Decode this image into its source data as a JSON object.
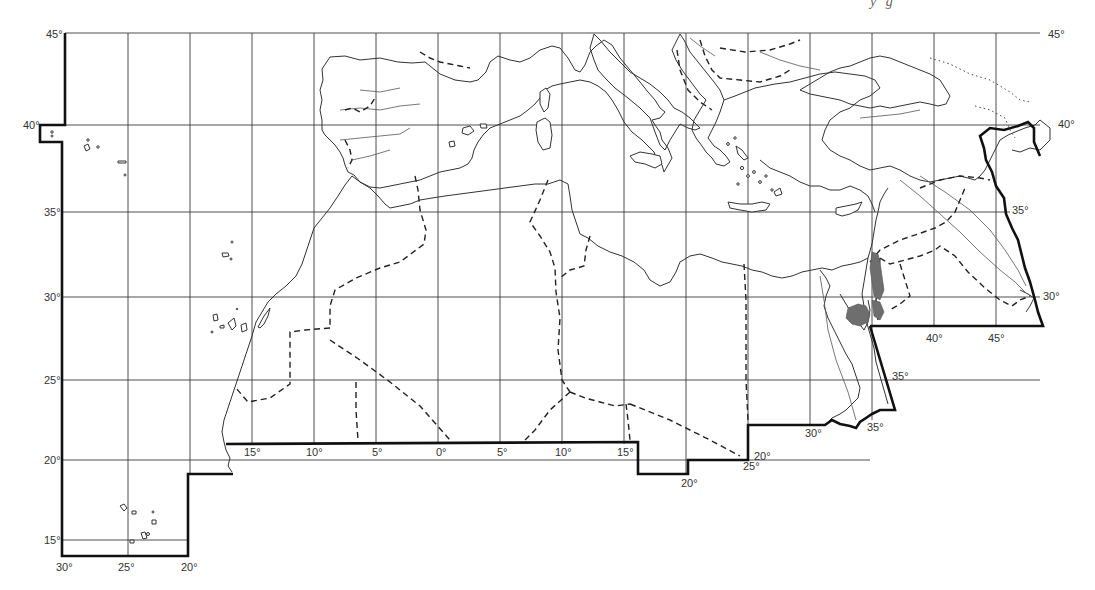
{
  "header": {
    "cropped_text_fragment": "y g"
  },
  "map": {
    "title": "",
    "region": "Mediterranean, North Africa and Middle East outline map",
    "latitude_labels_left": [
      "45°",
      "40°",
      "35°",
      "30°",
      "25°",
      "20°",
      "15°"
    ],
    "latitude_labels_right": [
      "45°",
      "40°",
      "35°",
      "30°"
    ],
    "longitude_labels_bottom_left": [
      "30°",
      "25°",
      "20°"
    ],
    "longitude_labels_west": [
      "15°",
      "10°",
      "5°",
      "0°"
    ],
    "longitude_labels_east": [
      "5°",
      "10°",
      "15°",
      "20°",
      "25°",
      "30°",
      "35°",
      "40°",
      "45°"
    ],
    "inner_step_labels": [
      "20°",
      "25°",
      "20°",
      "30°",
      "35°",
      "25°",
      "35°",
      "30°"
    ],
    "legend": {
      "solid_bold_line": "study area boundary",
      "dashed_line": "political boundaries",
      "thin_line": "coastlines and rivers",
      "dotted_line": "secondary boundaries",
      "shaded": "highlighted distribution area"
    },
    "colors": {
      "background": "#ffffff",
      "lines": "#333333",
      "frame": "#111111",
      "shade": "#6e6e6e"
    }
  }
}
